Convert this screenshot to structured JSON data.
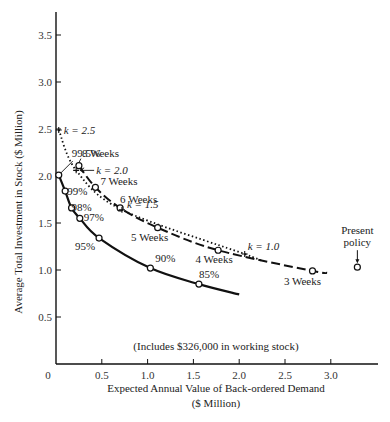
{
  "chart_data": {
    "type": "line",
    "title": "",
    "xlabel": "Expected Annual Value of Back-ordered Demand",
    "xlabel_unit": "($ Million)",
    "ylabel": "Average Total Investment in Stock ($ Million)",
    "xlim": [
      0,
      3.5
    ],
    "ylim": [
      0,
      3.75
    ],
    "x_ticks": [
      0,
      0.5,
      1.0,
      1.5,
      2.0,
      2.5,
      3.0
    ],
    "x_tick_labels": [
      "0",
      "0.5",
      "1.0",
      "1.5",
      "2.0",
      "2.5",
      "3.0"
    ],
    "y_ticks": [
      0.5,
      1.0,
      1.5,
      2.0,
      2.5,
      3.0,
      3.5
    ],
    "y_tick_labels": [
      "0.5",
      "1.0",
      "1.5",
      "2.0",
      "2.5",
      "3.0",
      "3.5"
    ],
    "grid": false,
    "note": "(Includes $326,000 in working stock)",
    "series": [
      {
        "name": "Service level curve",
        "style": "solid",
        "points": [
          {
            "x": 0.03,
            "y": 2.01,
            "label": "99.5%"
          },
          {
            "x": 0.1,
            "y": 1.84,
            "label": "99%"
          },
          {
            "x": 0.17,
            "y": 1.66,
            "label": "98%"
          },
          {
            "x": 0.26,
            "y": 1.55,
            "label": "97%"
          },
          {
            "x": 0.47,
            "y": 1.34,
            "label": "95%"
          },
          {
            "x": 1.03,
            "y": 1.02,
            "label": "90%"
          },
          {
            "x": 1.56,
            "y": 0.85,
            "label": "85%"
          },
          {
            "x": 2.0,
            "y": 0.74,
            "label": ""
          }
        ]
      },
      {
        "name": "Lead time (weeks) curve",
        "style": "dashed",
        "points": [
          {
            "x": 0.25,
            "y": 2.11,
            "label": "8 Weeks"
          },
          {
            "x": 0.43,
            "y": 1.88,
            "label": "7 Weeks"
          },
          {
            "x": 0.7,
            "y": 1.66,
            "label": "6 Weeks"
          },
          {
            "x": 1.11,
            "y": 1.45,
            "label": "5 Weeks"
          },
          {
            "x": 1.77,
            "y": 1.21,
            "label": "4 Weeks"
          },
          {
            "x": 2.8,
            "y": 0.99,
            "label": "3 Weeks"
          },
          {
            "x": 2.96,
            "y": 0.97,
            "label": ""
          }
        ]
      },
      {
        "name": "k-factor curve",
        "style": "dotted",
        "points": [
          {
            "x": 0.03,
            "y": 2.49,
            "label": "k = 2.5"
          },
          {
            "x": 0.22,
            "y": 2.06,
            "label": "k = 2.0"
          },
          {
            "x": 0.72,
            "y": 1.64,
            "label": "k = 1.5"
          },
          {
            "x": 2.06,
            "y": 1.17,
            "label": "k = 1.0"
          },
          {
            "x": 2.25,
            "y": 1.09,
            "label": ""
          }
        ]
      }
    ],
    "highlight_point": {
      "x": 3.29,
      "y": 1.03,
      "label": "Present policy"
    }
  },
  "labels": {
    "present_line1": "Present",
    "present_line2": "policy"
  }
}
